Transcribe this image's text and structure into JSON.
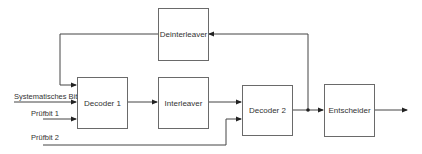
{
  "diagram": {
    "type": "block-diagram",
    "blocks": [
      {
        "id": "deinterleaver",
        "label": "Deinterleaver"
      },
      {
        "id": "decoder1",
        "label": "Decoder 1"
      },
      {
        "id": "interleaver",
        "label": "Interleaver"
      },
      {
        "id": "decoder2",
        "label": "Decoder 2"
      },
      {
        "id": "entscheider",
        "label": "Entscheider"
      }
    ],
    "inputs": [
      {
        "id": "systematic_bit",
        "label": "Systematisches Bit",
        "target": "decoder1"
      },
      {
        "id": "pruefbit1",
        "label": "Prüfbit 1",
        "target": "decoder1"
      },
      {
        "id": "pruefbit2",
        "label": "Prüfbit 2",
        "target": "decoder2"
      }
    ],
    "edges": [
      {
        "from": "deinterleaver",
        "to": "decoder1"
      },
      {
        "from": "decoder1",
        "to": "interleaver"
      },
      {
        "from": "interleaver",
        "to": "decoder2"
      },
      {
        "from": "decoder2",
        "to": "entscheider"
      },
      {
        "from": "decoder2",
        "to": "deinterleaver",
        "note": "feedback via junction"
      },
      {
        "from": "entscheider",
        "to": "output"
      }
    ],
    "colors": {
      "line": "#444444",
      "box_border": "#6a6a6a",
      "text": "#333333"
    }
  }
}
